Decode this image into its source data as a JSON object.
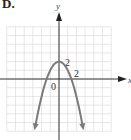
{
  "figure": {
    "label": "D."
  },
  "chart_data": {
    "type": "line",
    "title": "",
    "xlabel": "x",
    "ylabel": "y",
    "function": "y = -x^2 + 2",
    "tick_labels": {
      "x": [
        "2"
      ],
      "y": [
        "2"
      ],
      "origin": "0"
    },
    "x": [
      -3.4,
      -3,
      -2.5,
      -2,
      -1.5,
      -1,
      -0.5,
      0,
      0.5,
      1,
      1.5,
      2,
      2.5,
      3,
      3.4
    ],
    "values": [
      -9.56,
      -7,
      -4.25,
      -2,
      -0.25,
      1,
      1.75,
      2,
      1.75,
      1,
      -0.25,
      -2,
      -4.25,
      -7,
      -9.56
    ],
    "vertex": [
      0,
      2
    ],
    "x_intercepts": [
      -1.414,
      1.414
    ],
    "xlim": [
      -6,
      6
    ],
    "ylim": [
      -6,
      6
    ],
    "grid": true,
    "arrows_at_ends": true,
    "colors": {
      "curve": "#7a7a7a",
      "axes": "#333333",
      "grid": "#dcdcdc"
    }
  }
}
